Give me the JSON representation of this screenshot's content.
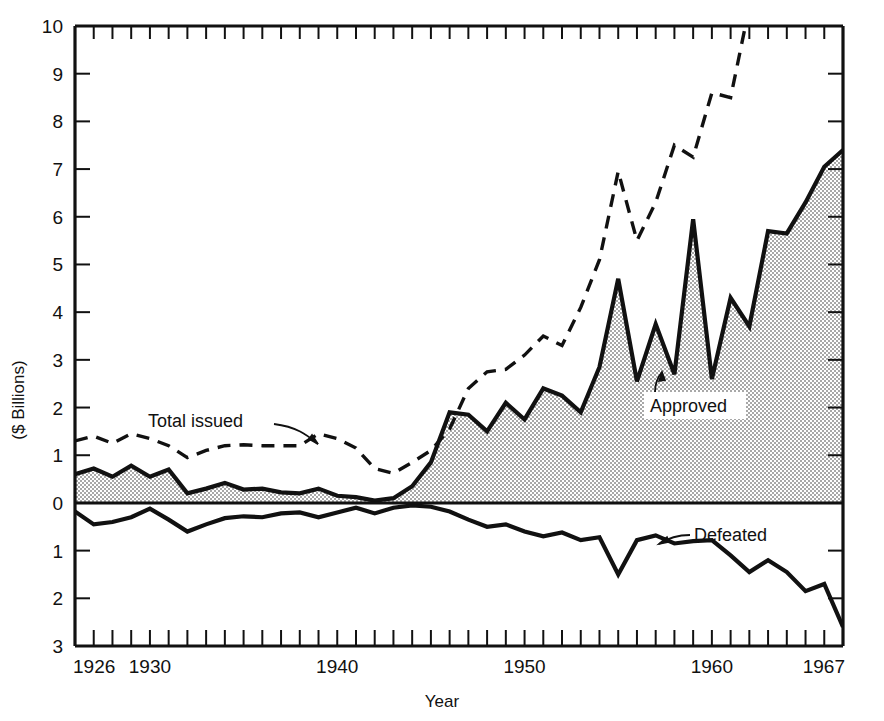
{
  "chart_data": {
    "type": "area",
    "title": "",
    "xlabel": "Year",
    "ylabel": "($ Billions)",
    "xlim": [
      1926,
      1967
    ],
    "ylim": [
      -3,
      10
    ],
    "grid": false,
    "legend_position": "inline-annotations",
    "y_tick_labels": [
      "10",
      "9",
      "8",
      "7",
      "6",
      "5",
      "4",
      "3",
      "2",
      "1",
      "0",
      "1",
      "2",
      "3"
    ],
    "y_tick_values": [
      10,
      9,
      8,
      7,
      6,
      5,
      4,
      3,
      2,
      1,
      0,
      -1,
      -2,
      -3
    ],
    "x_tick_labels": [
      "1926",
      "1930",
      "1940",
      "1950",
      "1960",
      "1967"
    ],
    "x_tick_values": [
      1926,
      1930,
      1940,
      1950,
      1960,
      1967
    ],
    "x_minor_tick_interval": 1,
    "x": [
      1926,
      1927,
      1928,
      1929,
      1930,
      1931,
      1932,
      1933,
      1934,
      1935,
      1936,
      1937,
      1938,
      1939,
      1940,
      1941,
      1942,
      1943,
      1944,
      1945,
      1946,
      1947,
      1948,
      1949,
      1950,
      1951,
      1952,
      1953,
      1954,
      1955,
      1956,
      1957,
      1958,
      1959,
      1960,
      1961,
      1962,
      1963,
      1964,
      1965,
      1966,
      1967
    ],
    "series": [
      {
        "name": "Total issued",
        "style": "dashed",
        "color": "#111111",
        "clipped_at_top": true,
        "values": [
          1.3,
          1.4,
          1.25,
          1.45,
          1.35,
          1.2,
          0.95,
          1.1,
          1.2,
          1.22,
          1.2,
          1.2,
          1.2,
          1.45,
          1.35,
          1.15,
          0.72,
          0.62,
          0.85,
          1.1,
          1.55,
          2.4,
          2.75,
          2.8,
          3.1,
          3.5,
          3.3,
          4.1,
          5.1,
          6.95,
          5.5,
          6.3,
          7.5,
          7.25,
          8.6,
          8.5,
          10.4,
          11.2,
          11.6,
          11.8,
          12.0,
          12.2
        ]
      },
      {
        "name": "Approved",
        "style": "filled-area",
        "color": "#111111",
        "fill": "#c9c9c9",
        "values": [
          0.6,
          0.72,
          0.55,
          0.78,
          0.55,
          0.7,
          0.2,
          0.3,
          0.42,
          0.28,
          0.3,
          0.22,
          0.2,
          0.3,
          0.15,
          0.12,
          0.05,
          0.1,
          0.35,
          0.85,
          1.9,
          1.85,
          1.5,
          2.1,
          1.75,
          2.4,
          2.25,
          1.9,
          2.85,
          4.7,
          2.55,
          3.75,
          2.7,
          5.95,
          2.6,
          4.3,
          3.7,
          5.7,
          5.65,
          6.3,
          7.05,
          7.4
        ]
      },
      {
        "name": "Defeated",
        "style": "solid-line",
        "color": "#111111",
        "values": [
          -0.18,
          -0.45,
          -0.4,
          -0.3,
          -0.12,
          -0.35,
          -0.6,
          -0.45,
          -0.32,
          -0.28,
          -0.3,
          -0.22,
          -0.2,
          -0.3,
          -0.2,
          -0.1,
          -0.22,
          -0.1,
          -0.05,
          -0.08,
          -0.18,
          -0.35,
          -0.5,
          -0.45,
          -0.6,
          -0.7,
          -0.62,
          -0.78,
          -0.72,
          -1.5,
          -0.78,
          -0.68,
          -0.85,
          -0.8,
          -0.78,
          -1.1,
          -1.45,
          -1.2,
          -1.45,
          -1.85,
          -1.7,
          -2.6
        ]
      }
    ],
    "annotations": [
      {
        "text": "Total issued",
        "points_to": "Total issued",
        "arrow": "down-right"
      },
      {
        "text": "Approved",
        "points_to": "Approved",
        "arrow": "up-left",
        "boxed": true
      },
      {
        "text": "Defeated",
        "points_to": "Defeated",
        "arrow": "left-down"
      }
    ]
  },
  "axes": {
    "y_label": "($ Billions)",
    "x_label": "Year"
  },
  "annotations": {
    "total_issued": "Total issued",
    "approved": "Approved",
    "defeated": "Defeated"
  },
  "colors": {
    "ink": "#111111",
    "fill": "#c9c9c9",
    "background": "#ffffff"
  }
}
